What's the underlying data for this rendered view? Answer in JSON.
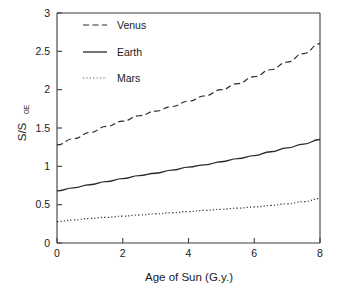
{
  "chart_data": {
    "type": "line",
    "title": "",
    "xlabel": "Age of Sun (G.y.)",
    "ylabel_main": "S/S",
    "ylabel_sub": "0E",
    "xlim": [
      0,
      8
    ],
    "ylim": [
      0,
      3
    ],
    "xticks": [
      "0",
      "2",
      "4",
      "6",
      "8"
    ],
    "xtick_values": [
      0,
      2,
      4,
      6,
      8
    ],
    "yticks": [
      "0",
      "0.5",
      "1",
      "1.5",
      "2",
      "2.5",
      "3"
    ],
    "ytick_values": [
      0,
      0.5,
      1,
      1.5,
      2,
      2.5,
      3
    ],
    "grid": false,
    "legend_position": "upper-left",
    "x": [
      0,
      0.5,
      1,
      1.5,
      2,
      2.5,
      3,
      3.5,
      4,
      4.5,
      5,
      5.5,
      6,
      6.5,
      7,
      7.5,
      8
    ],
    "series": [
      {
        "name": "Venus",
        "style": "dashed",
        "color": "#2b2b2b",
        "values": [
          1.28,
          1.36,
          1.44,
          1.52,
          1.59,
          1.66,
          1.72,
          1.78,
          1.85,
          1.92,
          2.0,
          2.08,
          2.17,
          2.26,
          2.36,
          2.47,
          2.6
        ]
      },
      {
        "name": "Earth",
        "style": "solid",
        "color": "#2b2b2b",
        "values": [
          0.68,
          0.72,
          0.76,
          0.8,
          0.84,
          0.88,
          0.91,
          0.95,
          0.99,
          1.02,
          1.06,
          1.1,
          1.14,
          1.19,
          1.24,
          1.29,
          1.35
        ]
      },
      {
        "name": "Mars",
        "style": "dotted",
        "color": "#5a5a5a",
        "values": [
          0.28,
          0.3,
          0.32,
          0.335,
          0.35,
          0.365,
          0.38,
          0.395,
          0.41,
          0.425,
          0.44,
          0.455,
          0.47,
          0.49,
          0.51,
          0.54,
          0.58
        ]
      }
    ]
  }
}
